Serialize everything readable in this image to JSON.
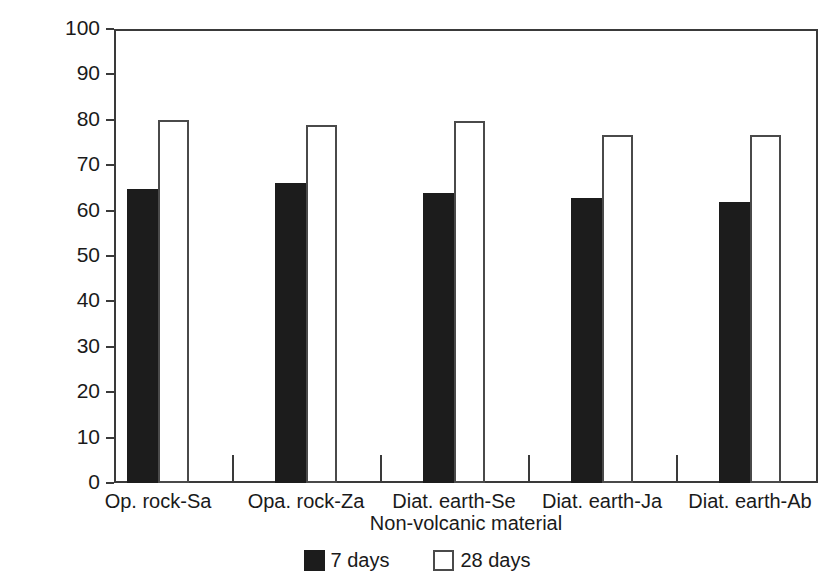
{
  "chart_data": {
    "type": "bar",
    "title": "",
    "xlabel": "Non-volcanic material",
    "ylabel": "Lime fixed (%)",
    "categories": [
      "Op. rock-Sa",
      "Opa. rock-Za",
      "Diat. earth-Se",
      "Diat. earth-Ja",
      "Diat. earth-Ab"
    ],
    "series": [
      {
        "name": "7 days",
        "color": "#1c1c1c",
        "values": [
          64.7,
          66.0,
          63.8,
          62.8,
          61.8
        ]
      },
      {
        "name": "28 days",
        "color": "#ffffff",
        "values": [
          79.9,
          78.8,
          79.8,
          76.7,
          76.7
        ]
      }
    ],
    "ylim": [
      0,
      100
    ],
    "yticks": [
      100,
      90,
      80,
      70,
      60,
      50,
      40,
      30,
      20,
      10,
      0
    ],
    "ytick_labels": [
      "100",
      "90",
      "80",
      "70",
      "60",
      "50",
      "40",
      "30",
      "20",
      "10",
      "0"
    ],
    "grid": false,
    "legend_position": "bottom-center",
    "frame": true
  },
  "legend": {
    "items": [
      {
        "label": "7 days",
        "swatch": "filled-black-square"
      },
      {
        "label": "28 days",
        "swatch": "open-white-square"
      }
    ]
  }
}
